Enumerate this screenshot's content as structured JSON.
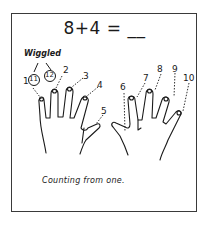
{
  "equation": "8+4 = __",
  "annotation_label": "Wiggled",
  "caption": "Counting from one.",
  "left_hand": {
    "finger_labels": [
      "1",
      "2",
      "3",
      "4",
      "5"
    ],
    "circled_labels": [
      "11",
      "12"
    ]
  },
  "right_hand": {
    "finger_labels": [
      "6",
      "7",
      "8",
      "9",
      "10"
    ]
  },
  "colors": {
    "ink": "#1a1a1a",
    "border": "#3a3a3a",
    "background": "#ffffff"
  }
}
